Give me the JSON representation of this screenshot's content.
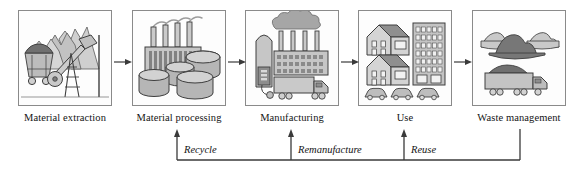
{
  "diagram": {
    "stages": [
      {
        "id": "material-extraction",
        "label": "Material extraction",
        "icon": "mining-cart-oil-pump-mountains-icon",
        "x": 18
      },
      {
        "id": "material-processing",
        "label": "Material processing",
        "icon": "factory-smokestacks-storage-tanks-icon",
        "x": 132
      },
      {
        "id": "manufacturing",
        "label": "Manufacturing",
        "icon": "factory-smoke-cloud-truck-icon",
        "x": 245
      },
      {
        "id": "use",
        "label": "Use",
        "icon": "houses-apartment-cars-icon",
        "x": 358
      },
      {
        "id": "waste-management",
        "label": "Waste management",
        "icon": "waste-piles-dump-truck-icon",
        "x": 472
      }
    ],
    "flow_arrows": [
      {
        "id": "arrow-extraction-to-processing",
        "x": 114
      },
      {
        "id": "arrow-processing-to-manufacturing",
        "x": 228
      },
      {
        "id": "arrow-manufacturing-to-use",
        "x": 341
      },
      {
        "id": "arrow-use-to-waste",
        "x": 454
      }
    ],
    "feedback_loops": [
      {
        "id": "recycle",
        "label": "Recycle",
        "arrow_x": 177,
        "label_x": 184
      },
      {
        "id": "remanufacture",
        "label": "Remanufacture",
        "arrow_x": 291,
        "label_x": 298
      },
      {
        "id": "reuse",
        "label": "Reuse",
        "arrow_x": 404,
        "label_x": 411
      }
    ],
    "loop_bus": {
      "baseline_y": 160,
      "source_x": 520,
      "source_top_y": 129,
      "arrow_top_y": 131
    },
    "colors": {
      "line": "#3a3a3a",
      "panel_border": "#8a8a8a",
      "fill_light": "#d8d8d8",
      "fill_mid": "#bdbdbd",
      "fill_dark": "#8f8f8f",
      "fill_darkest": "#6e6e6e",
      "text": "#141414"
    }
  }
}
